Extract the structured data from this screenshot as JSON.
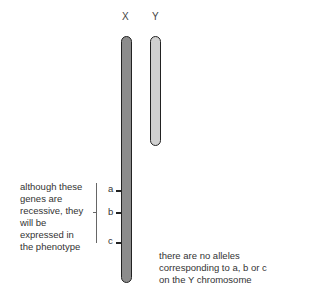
{
  "chromosomes": [
    {
      "label": "X",
      "fill": "#8c8c8c"
    },
    {
      "label": "Y",
      "fill": "#d0d0d0"
    }
  ],
  "markers": [
    {
      "label": "a"
    },
    {
      "label": "b"
    },
    {
      "label": "c"
    }
  ],
  "annotations": {
    "left_note": [
      "although these",
      "genes are",
      "recessive, they",
      "will be",
      "expressed in",
      "the phenotype"
    ],
    "right_note": [
      "there are no alleles",
      "corresponding to a, b or c",
      "on the Y chromosome"
    ]
  }
}
